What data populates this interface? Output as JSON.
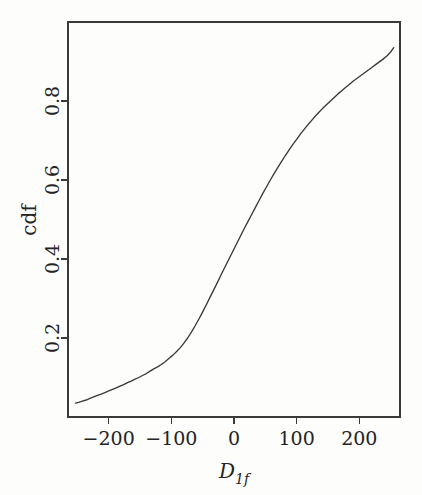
{
  "chart_data": {
    "type": "line",
    "title": "",
    "subtitle": "",
    "xlabel": "D_1f",
    "xlabel_display": "D",
    "xlabel_subscript": "1f",
    "ylabel": "cdf",
    "xlim": [
      -265,
      265
    ],
    "ylim": [
      0.0,
      1.0
    ],
    "grid": false,
    "legend": null,
    "x_ticks": [
      -200,
      -100,
      0,
      100,
      200
    ],
    "x_tick_labels": [
      "-200",
      "-100",
      "0",
      "100",
      "200"
    ],
    "y_ticks": [
      0.2,
      0.4,
      0.6,
      0.8
    ],
    "y_tick_labels": [
      "0.2",
      "0.4",
      "0.6",
      "0.8"
    ],
    "series": [
      {
        "name": "cdf",
        "color": "#39383c",
        "x": [
          -253,
          -248,
          -242,
          -236,
          -230,
          -224,
          -218,
          -212,
          -206,
          -200,
          -194,
          -188,
          -182,
          -176,
          -170,
          -164,
          -158,
          -152,
          -146,
          -140,
          -134,
          -128,
          -122,
          -116,
          -110,
          -104,
          -98,
          -92,
          -86,
          -80,
          -74,
          -68,
          -62,
          -56,
          -50,
          -44,
          -38,
          -32,
          -26,
          -20,
          -14,
          -8,
          -2,
          4,
          10,
          16,
          22,
          28,
          34,
          40,
          46,
          52,
          58,
          64,
          70,
          76,
          82,
          88,
          94,
          100,
          106,
          112,
          118,
          124,
          130,
          136,
          142,
          148,
          154,
          160,
          166,
          172,
          178,
          184,
          190,
          196,
          202,
          208,
          214,
          220,
          226,
          232,
          238,
          244,
          250,
          255
        ],
        "y": [
          0.035,
          0.037,
          0.04,
          0.043,
          0.047,
          0.051,
          0.055,
          0.058,
          0.062,
          0.066,
          0.07,
          0.074,
          0.078,
          0.082,
          0.087,
          0.091,
          0.096,
          0.1,
          0.105,
          0.11,
          0.116,
          0.122,
          0.127,
          0.133,
          0.14,
          0.148,
          0.156,
          0.165,
          0.175,
          0.187,
          0.2,
          0.215,
          0.231,
          0.248,
          0.266,
          0.285,
          0.304,
          0.323,
          0.342,
          0.362,
          0.381,
          0.4,
          0.419,
          0.438,
          0.457,
          0.476,
          0.494,
          0.512,
          0.53,
          0.548,
          0.566,
          0.583,
          0.6,
          0.616,
          0.632,
          0.647,
          0.662,
          0.676,
          0.69,
          0.703,
          0.716,
          0.728,
          0.74,
          0.751,
          0.762,
          0.772,
          0.782,
          0.791,
          0.8,
          0.809,
          0.818,
          0.826,
          0.834,
          0.842,
          0.85,
          0.857,
          0.864,
          0.871,
          0.878,
          0.885,
          0.892,
          0.899,
          0.906,
          0.914,
          0.924,
          0.935
        ]
      }
    ]
  },
  "figure": {
    "axis_color": "#3a3a3a",
    "curve_color": "#39383c",
    "background": "#fdfdfc"
  }
}
